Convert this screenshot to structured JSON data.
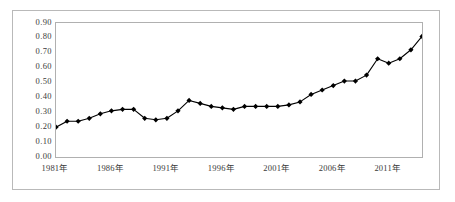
{
  "chart_data": {
    "type": "line",
    "title": "",
    "subtitle": "",
    "xlabel": "",
    "ylabel": "",
    "grid": false,
    "legend": null,
    "legend_position": "none",
    "marker": "filled-diamond",
    "line_color": "#000000",
    "marker_color": "#000000",
    "xlim": [
      1981,
      2014
    ],
    "ylim": [
      0.0,
      0.9
    ],
    "ytick_labels": [
      "0.90",
      "0.80",
      "0.70",
      "0.60",
      "0.50",
      "0.40",
      "0.30",
      "0.20",
      "0.10",
      "0.00"
    ],
    "ytick_values": [
      0.9,
      0.8,
      0.7,
      0.6,
      0.5,
      0.4,
      0.3,
      0.2,
      0.1,
      0.0
    ],
    "xtick_labels": [
      "1981年",
      "1986年",
      "1991年",
      "1996年",
      "2001年",
      "2006年",
      "2011年"
    ],
    "xtick_values": [
      1981,
      1986,
      1991,
      1996,
      2001,
      2006,
      2011
    ],
    "x": [
      1981,
      1982,
      1983,
      1984,
      1985,
      1986,
      1987,
      1988,
      1989,
      1990,
      1991,
      1992,
      1993,
      1994,
      1995,
      1996,
      1997,
      1998,
      1999,
      2000,
      2001,
      2002,
      2003,
      2004,
      2005,
      2006,
      2007,
      2008,
      2009,
      2010,
      2011,
      2012,
      2013,
      2014
    ],
    "values": [
      0.2,
      0.24,
      0.24,
      0.26,
      0.29,
      0.31,
      0.32,
      0.32,
      0.26,
      0.25,
      0.26,
      0.31,
      0.38,
      0.36,
      0.34,
      0.33,
      0.32,
      0.34,
      0.34,
      0.34,
      0.34,
      0.35,
      0.37,
      0.42,
      0.45,
      0.48,
      0.51,
      0.51,
      0.55,
      0.66,
      0.63,
      0.66,
      0.72,
      0.81
    ]
  }
}
